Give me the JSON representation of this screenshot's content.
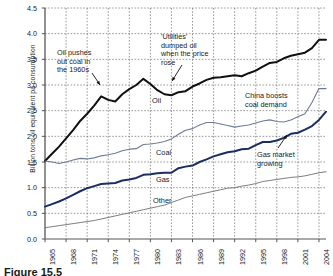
{
  "figure": {
    "caption": "Figure 15.5"
  },
  "chart_data": {
    "type": "line",
    "title": "",
    "xlabel": "",
    "ylabel": "Billion tons oil equivalent pa consumption",
    "xlim": [
      1965,
      2005
    ],
    "ylim": [
      0.0,
      4.5
    ],
    "grid": true,
    "legend": "inline-labels",
    "ytick_labels": [
      "0.0",
      "0.5",
      "1.0",
      "1.5",
      "2.0",
      "2.5",
      "3.0",
      "3.5",
      "4.0",
      "4.5"
    ],
    "ytick_values": [
      0.0,
      0.5,
      1.0,
      1.5,
      2.0,
      2.5,
      3.0,
      3.5,
      4.0,
      4.5
    ],
    "xtick_labels": [
      "1965",
      "1968",
      "1971",
      "1974",
      "1977",
      "1980",
      "1983",
      "1986",
      "1989",
      "1992",
      "1995",
      "1998",
      "2001",
      "2004"
    ],
    "xtick_values": [
      1965,
      1968,
      1971,
      1974,
      1977,
      1980,
      1983,
      1986,
      1989,
      1992,
      1995,
      1998,
      2001,
      2004
    ],
    "x": [
      1965,
      1966,
      1967,
      1968,
      1969,
      1970,
      1971,
      1972,
      1973,
      1974,
      1975,
      1976,
      1977,
      1978,
      1979,
      1980,
      1981,
      1982,
      1983,
      1984,
      1985,
      1986,
      1987,
      1988,
      1989,
      1990,
      1991,
      1992,
      1993,
      1994,
      1995,
      1996,
      1997,
      1998,
      1999,
      2000,
      2001,
      2002,
      2003,
      2004,
      2005
    ],
    "series": [
      {
        "name": "Oil",
        "color": "#101010",
        "width": 2.0,
        "values": [
          1.52,
          1.66,
          1.8,
          1.96,
          2.12,
          2.3,
          2.44,
          2.6,
          2.78,
          2.71,
          2.68,
          2.82,
          2.92,
          3.0,
          3.12,
          3.02,
          2.9,
          2.82,
          2.8,
          2.86,
          2.88,
          2.97,
          3.03,
          3.1,
          3.14,
          3.15,
          3.17,
          3.19,
          3.17,
          3.23,
          3.28,
          3.36,
          3.43,
          3.45,
          3.52,
          3.57,
          3.6,
          3.63,
          3.72,
          3.88,
          3.88
        ]
      },
      {
        "name": "Coal",
        "color": "#6d7b96",
        "width": 1.1,
        "values": [
          1.52,
          1.5,
          1.47,
          1.5,
          1.54,
          1.57,
          1.56,
          1.58,
          1.62,
          1.64,
          1.67,
          1.72,
          1.75,
          1.76,
          1.84,
          1.85,
          1.87,
          1.9,
          1.95,
          2.04,
          2.12,
          2.15,
          2.22,
          2.27,
          2.27,
          2.24,
          2.21,
          2.18,
          2.2,
          2.22,
          2.26,
          2.3,
          2.32,
          2.29,
          2.28,
          2.32,
          2.38,
          2.44,
          2.66,
          2.93,
          2.93
        ]
      },
      {
        "name": "Gas",
        "color": "#1b2d63",
        "width": 2.0,
        "values": [
          0.63,
          0.68,
          0.73,
          0.79,
          0.86,
          0.93,
          0.99,
          1.03,
          1.07,
          1.08,
          1.09,
          1.14,
          1.16,
          1.19,
          1.25,
          1.26,
          1.28,
          1.29,
          1.29,
          1.38,
          1.41,
          1.43,
          1.5,
          1.55,
          1.61,
          1.65,
          1.69,
          1.71,
          1.75,
          1.76,
          1.83,
          1.89,
          1.89,
          1.92,
          1.97,
          2.05,
          2.07,
          2.13,
          2.2,
          2.32,
          2.48
        ]
      },
      {
        "name": "Other",
        "color": "#7d7d7d",
        "width": 1.0,
        "values": [
          0.22,
          0.24,
          0.26,
          0.28,
          0.3,
          0.32,
          0.34,
          0.36,
          0.39,
          0.42,
          0.45,
          0.48,
          0.51,
          0.54,
          0.57,
          0.6,
          0.63,
          0.66,
          0.71,
          0.76,
          0.81,
          0.84,
          0.87,
          0.9,
          0.93,
          0.96,
          0.99,
          1.0,
          1.03,
          1.05,
          1.08,
          1.12,
          1.14,
          1.16,
          1.18,
          1.2,
          1.21,
          1.23,
          1.26,
          1.29,
          1.31
        ]
      }
    ],
    "series_labels": [
      {
        "name": "Oil",
        "text": "Oil",
        "x": 152,
        "y": 96
      },
      {
        "name": "Coal",
        "text": "Coal",
        "x": 156,
        "y": 148
      },
      {
        "name": "Gas",
        "text": "Gas",
        "x": 156,
        "y": 175
      },
      {
        "name": "Other",
        "text": "Other",
        "x": 153,
        "y": 196
      }
    ],
    "annotations": [
      {
        "id": "oil-pushes-out-coal",
        "lines": [
          "Oil pushes",
          "out coal in",
          "the 1960s"
        ],
        "x": 57,
        "y": 49,
        "arrow": {
          "x1": 92,
          "y1": 73,
          "x2": 100,
          "y2": 85
        }
      },
      {
        "id": "utilities-dumped-oil",
        "lines": [
          "'Utilities'",
          "dumped oil",
          "when the price",
          "rose"
        ],
        "x": 161,
        "y": 33,
        "arrow": {
          "x1": 182,
          "y1": 65,
          "x2": 172,
          "y2": 81
        }
      },
      {
        "id": "china-boosts-coal-demand",
        "lines": [
          "China boosts",
          "coal demand"
        ],
        "x": 245,
        "y": 92,
        "arrow": null
      },
      {
        "id": "gas-market-growing",
        "lines": [
          "Gas market",
          "growing"
        ],
        "x": 257,
        "y": 151,
        "arrow": {
          "x1": 278,
          "y1": 148,
          "x2": 287,
          "y2": 135
        }
      }
    ]
  }
}
